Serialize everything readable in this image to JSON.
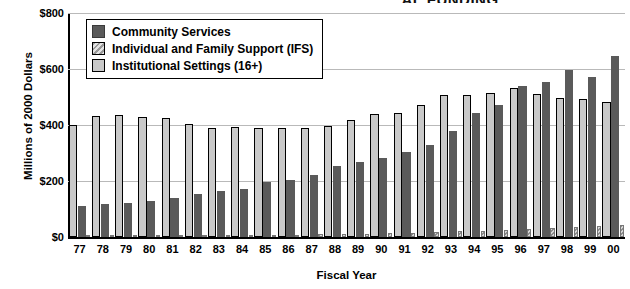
{
  "title_clipped": "AL FUNDING",
  "chart_data": {
    "type": "bar",
    "title": "",
    "xlabel": "Fiscal Year",
    "ylabel": "Millions of 2000 Dollars",
    "ylim": [
      0,
      800
    ],
    "yticks": [
      0,
      200,
      400,
      600,
      800
    ],
    "ytick_labels": [
      "$0",
      "$200",
      "$400",
      "$600",
      "$800"
    ],
    "grid": true,
    "legend_position": "top-left-inside",
    "categories": [
      "77",
      "78",
      "79",
      "80",
      "81",
      "82",
      "83",
      "84",
      "85",
      "86",
      "87",
      "88",
      "89",
      "90",
      "91",
      "92",
      "93",
      "94",
      "95",
      "96",
      "97",
      "98",
      "99",
      "00"
    ],
    "series": [
      {
        "name": "Community Services",
        "color": "#5a5a5a",
        "values": [
          110,
          118,
          122,
          128,
          138,
          152,
          163,
          172,
          195,
          205,
          222,
          253,
          268,
          283,
          303,
          330,
          378,
          443,
          470,
          540,
          553,
          595,
          570,
          645
        ]
      },
      {
        "name": "Individual and Family Support (IFS)",
        "color": "#a8a8a8",
        "values": [
          2,
          2,
          3,
          3,
          4,
          5,
          5,
          6,
          7,
          8,
          9,
          10,
          11,
          13,
          15,
          17,
          20,
          22,
          26,
          28,
          32,
          36,
          38,
          42
        ]
      },
      {
        "name": "Institutional Settings (16+)",
        "color": "#c9c9c9",
        "values": [
          400,
          432,
          435,
          430,
          425,
          403,
          390,
          392,
          388,
          388,
          388,
          398,
          418,
          440,
          443,
          472,
          508,
          508,
          513,
          533,
          512,
          495,
          493,
          483
        ]
      }
    ]
  }
}
